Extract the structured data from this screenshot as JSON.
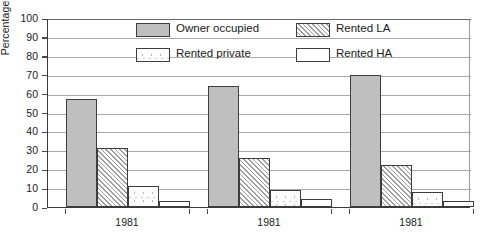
{
  "chart_data": {
    "type": "bar",
    "title": "",
    "xlabel": "",
    "ylabel": "Percentage",
    "ylim": [
      0,
      100
    ],
    "ytick_step": 10,
    "grid": true,
    "legend_position": "inside-top-center",
    "categories": [
      "1981",
      "1981",
      "1981"
    ],
    "yticks": [
      "100",
      "90",
      "80",
      "70",
      "60",
      "50",
      "40",
      "30",
      "20",
      "10",
      "0"
    ],
    "series": [
      {
        "name": "Owner occupied",
        "pattern": "solid-gray",
        "values": [
          57,
          64,
          70
        ]
      },
      {
        "name": "Rented LA",
        "pattern": "diagonal-hatch",
        "values": [
          31,
          26,
          22
        ]
      },
      {
        "name": "Rented private",
        "pattern": "stipple-dots",
        "values": [
          11,
          9,
          8
        ]
      },
      {
        "name": "Rented HA",
        "pattern": "white-empty",
        "values": [
          3,
          4,
          3
        ]
      }
    ]
  },
  "legend": {
    "items": [
      {
        "label": "Owner occupied"
      },
      {
        "label": "Rented LA"
      },
      {
        "label": "Rented private"
      },
      {
        "label": "Rented HA"
      }
    ]
  },
  "axis": {
    "y_title": "Percentage"
  },
  "colors": {
    "series_owner_occupied": "#bfbfbf",
    "series_rented_la": "#9d9d9d",
    "series_rented_private": "#c9c9c9",
    "series_rented_ha": "#ffffff",
    "axis": "#3a3a3a",
    "grid": "#a9a9a9",
    "text": "#1a1a1a"
  }
}
